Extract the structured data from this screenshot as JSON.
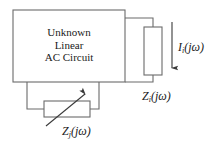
{
  "diagram": {
    "stroke_color": "#6b6b6b",
    "text_color": "#1a1a1a",
    "background_color": "#ffffff",
    "main_block": {
      "line1": "Unknown",
      "line2": "Linear",
      "line3": "AC Circuit",
      "full_text": "Unknown Linear AC Circuit"
    },
    "labels": {
      "current": {
        "symbol": "I",
        "subscript": "i",
        "argument": "(jω)",
        "full_text": "Ii(jω)"
      },
      "load_impedance": {
        "symbol": "Z",
        "subscript": "i",
        "argument": "(jω)",
        "full_text": "Zi(jω)"
      },
      "variable_impedance": {
        "symbol": "Z",
        "subscript": "j",
        "argument": "(jω)",
        "full_text": "Zj(jω)"
      }
    },
    "elements": {
      "load_box_name": "vertical impedance element",
      "variable_box_name": "variable impedance element",
      "current_arrow_name": "downward current direction arrow",
      "variable_arrow_name": "diagonal variability arrow"
    }
  }
}
